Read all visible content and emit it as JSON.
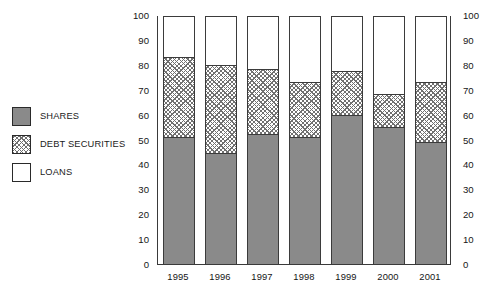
{
  "chart_data": {
    "type": "bar",
    "subtype": "stacked-100-percent",
    "title": "",
    "xlabel": "",
    "ylabel": "",
    "ylim": [
      0,
      100
    ],
    "grid": false,
    "legend_position": "left",
    "categories": [
      "1995",
      "1996",
      "1997",
      "1998",
      "1999",
      "2000",
      "2001"
    ],
    "ytick_labels": [
      "100",
      "90",
      "80",
      "70",
      "60",
      "50",
      "40",
      "30",
      "20",
      "10",
      "0"
    ],
    "ytick_values": [
      100,
      90,
      80,
      70,
      60,
      50,
      40,
      30,
      20,
      10,
      0
    ],
    "dual_axis": true,
    "series": [
      {
        "name": "SHARES",
        "color": "#8a8a8a",
        "fill": "solid",
        "values": [
          51.5,
          45.0,
          52.5,
          51.5,
          60.5,
          55.5,
          49.5
        ]
      },
      {
        "name": "DEBT SECURITIES",
        "color": "#707070",
        "fill": "crosshatch",
        "values": [
          32.5,
          35.5,
          26.5,
          22.0,
          17.5,
          13.5,
          24.0
        ]
      },
      {
        "name": "LOANS",
        "color": "#ffffff",
        "fill": "empty",
        "values": [
          16.0,
          19.5,
          21.0,
          26.5,
          22.0,
          31.0,
          26.5
        ]
      }
    ],
    "cumulative_tops": {
      "shares": [
        51.5,
        45.0,
        52.5,
        51.5,
        60.5,
        55.5,
        49.5
      ],
      "debt_securities": [
        84.0,
        80.5,
        79.0,
        73.5,
        78.0,
        69.0,
        73.5
      ],
      "loans": [
        100,
        100,
        100,
        100,
        100,
        100,
        100
      ]
    }
  },
  "legend": {
    "items": [
      {
        "label": "SHARES",
        "swatch": "solid-gray-swatch"
      },
      {
        "label": "DEBT SECURITIES",
        "swatch": "crosshatch-swatch"
      },
      {
        "label": "LOANS",
        "swatch": "empty-white-swatch"
      }
    ]
  }
}
